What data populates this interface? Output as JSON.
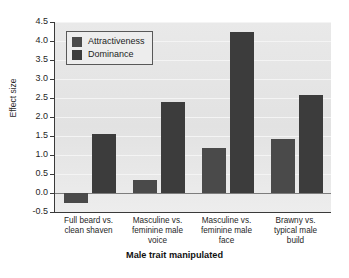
{
  "chart_data": {
    "type": "bar",
    "title": "",
    "xlabel": "Male trait manipulated",
    "ylabel": "Effect size",
    "ylim": [
      -0.5,
      4.5
    ],
    "ytick_step": 0.5,
    "grid": true,
    "legend_position": "top-left-inside",
    "categories": [
      "Full beard vs.\nclean shaven",
      "Masculine vs.\nfeminine male\nvoice",
      "Masculine vs.\nfeminine male\nface",
      "Brawny vs.\ntypical male\nbuild"
    ],
    "category_lines": [
      [
        "Full beard vs.",
        "clean shaven"
      ],
      [
        "Masculine vs.",
        "feminine male",
        "voice"
      ],
      [
        "Masculine vs.",
        "feminine male",
        "face"
      ],
      [
        "Brawny vs.",
        "typical male",
        "build"
      ]
    ],
    "series": [
      {
        "name": "Attractiveness",
        "color": "#4a4a4a",
        "values": [
          -0.26,
          0.33,
          1.19,
          1.43
        ]
      },
      {
        "name": "Dominance",
        "color": "#3c3c3c",
        "values": [
          1.54,
          2.4,
          4.25,
          2.57
        ]
      }
    ],
    "ytick_labels": [
      "4.5",
      "4.0",
      "3.5",
      "3.0",
      "2.5",
      "2.0",
      "1.5",
      "1.0",
      "0.5",
      "0.0",
      "-0.5"
    ],
    "ytick_values": [
      4.5,
      4.0,
      3.5,
      3.0,
      2.5,
      2.0,
      1.5,
      1.0,
      0.5,
      0.0,
      -0.5
    ]
  }
}
